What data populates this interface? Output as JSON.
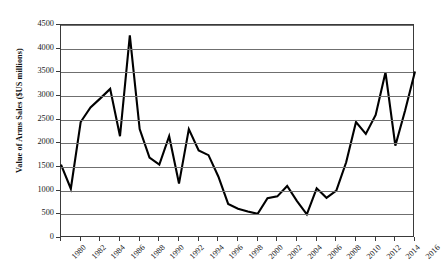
{
  "chart_data": {
    "type": "line",
    "title": "",
    "xlabel": "",
    "ylabel": "Value of Arms Sales ($US millions)",
    "ylim": [
      0,
      4500
    ],
    "ytick_step": 500,
    "yticks": [
      0,
      500,
      1000,
      1500,
      2000,
      2500,
      3000,
      3500,
      4000,
      4500
    ],
    "ytick_labels": [
      "0",
      "500",
      "1000",
      "1500",
      "2000",
      "2500",
      "3000",
      "3500",
      "4000",
      "4500"
    ],
    "xlim": [
      1980,
      2016
    ],
    "xticks": [
      1980,
      1982,
      1984,
      1986,
      1988,
      1990,
      1992,
      1994,
      1996,
      1998,
      2000,
      2002,
      2004,
      2006,
      2008,
      2010,
      2012,
      2014,
      2016
    ],
    "xtick_labels": [
      "1980",
      "1982",
      "1984",
      "1986",
      "1988",
      "1990",
      "1992",
      "1994",
      "1996",
      "1998",
      "2000",
      "2002",
      "2004",
      "2006",
      "2008",
      "2010",
      "2012",
      "2014",
      "2016"
    ],
    "xtick_rotation": -45,
    "grid": "horizontal",
    "legend": "none",
    "line_color": "#000000",
    "line_width": 2.1,
    "x": [
      1980,
      1981,
      1982,
      1983,
      1984,
      1985,
      1986,
      1987,
      1988,
      1989,
      1990,
      1991,
      1992,
      1993,
      1994,
      1995,
      1996,
      1997,
      1998,
      1999,
      2000,
      2001,
      2002,
      2003,
      2004,
      2005,
      2006,
      2007,
      2008,
      2009,
      2010,
      2011,
      2012,
      2013,
      2014,
      2015,
      2016
    ],
    "values": [
      1550,
      1040,
      2450,
      2760,
      2950,
      3150,
      2150,
      4280,
      2300,
      1700,
      1550,
      2150,
      1150,
      2300,
      1850,
      1750,
      1300,
      720,
      620,
      560,
      510,
      840,
      880,
      1100,
      780,
      500,
      1050,
      850,
      1000,
      1600,
      2450,
      2200,
      2600,
      3500,
      1950,
      2700,
      3520
    ],
    "series": [
      {
        "name": "Value of Arms Sales",
        "values": [
          1550,
          1040,
          2450,
          2760,
          2950,
          3150,
          2150,
          4280,
          2300,
          1700,
          1550,
          2150,
          1150,
          2300,
          1850,
          1750,
          1300,
          720,
          620,
          560,
          510,
          840,
          880,
          1100,
          780,
          500,
          1050,
          850,
          1000,
          1600,
          2450,
          2200,
          2600,
          3500,
          1950,
          2700,
          3520
        ]
      }
    ]
  }
}
